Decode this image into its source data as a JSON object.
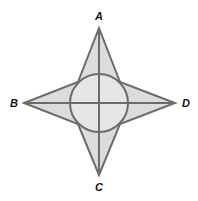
{
  "diagram": {
    "type": "four-pointed star with inscribed circle",
    "colors": {
      "fill": "#dcdcdc",
      "circle_fill": "#e6e6e6",
      "stroke": "#6b6b6b",
      "label": "#111111",
      "background": "#ffffff"
    },
    "center": [
      99,
      103
    ],
    "circle_radius": 29,
    "vertices": {
      "A": {
        "label": "A",
        "tip": [
          99,
          28
        ],
        "label_pos": [
          99,
          20
        ]
      },
      "B": {
        "label": "B",
        "tip": [
          24,
          103
        ],
        "label_pos": [
          14,
          107
        ]
      },
      "C": {
        "label": "C",
        "tip": [
          99,
          175
        ],
        "label_pos": [
          99,
          191
        ]
      },
      "D": {
        "label": "D",
        "tip": [
          175,
          103
        ],
        "label_pos": [
          186,
          107
        ]
      }
    },
    "segments": [
      "AC",
      "BD"
    ]
  }
}
